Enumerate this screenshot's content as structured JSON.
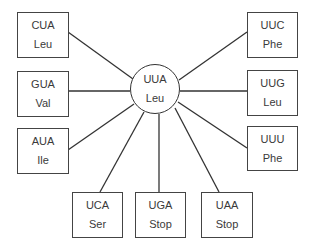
{
  "center": {
    "codon": "UUA",
    "amino_acid": "Leu"
  },
  "nodes": [
    {
      "id": "cua",
      "codon": "CUA",
      "amino_acid": "Leu",
      "position": "left-top"
    },
    {
      "id": "gua",
      "codon": "GUA",
      "amino_acid": "Val",
      "position": "left-middle"
    },
    {
      "id": "aua",
      "codon": "AUA",
      "amino_acid": "Ile",
      "position": "left-bottom"
    },
    {
      "id": "ucа",
      "codon": "UCA",
      "amino_acid": "Ser",
      "position": "bottom-left"
    },
    {
      "id": "uga",
      "codon": "UGA",
      "amino_acid": "Stop",
      "position": "bottom-middle"
    },
    {
      "id": "uaa",
      "codon": "UAA",
      "amino_acid": "Stop",
      "position": "bottom-right"
    },
    {
      "id": "uuc",
      "codon": "UUC",
      "amino_acid": "Phe",
      "position": "right-top"
    },
    {
      "id": "uug",
      "codon": "UUG",
      "amino_acid": "Leu",
      "position": "right-middle"
    },
    {
      "id": "uuu",
      "codon": "UUU",
      "amino_acid": "Phe",
      "position": "right-bottom"
    }
  ],
  "colors": {
    "line": "#333333",
    "text": "#3a3a3a",
    "background": "#ffffff"
  }
}
